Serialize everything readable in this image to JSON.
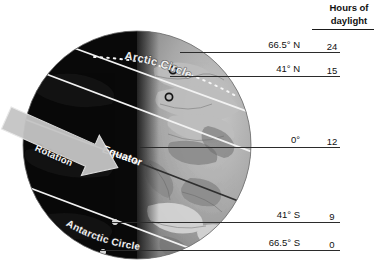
{
  "diagram": {
    "type": "earth-daylight-illumination",
    "globe": {
      "equator_label": "Equator",
      "arctic_circle_label": "Arctic Circle",
      "antarctic_circle_label": "Antarctic Circle",
      "rotation_label": "Rotation",
      "night_side_color": "#090909",
      "day_side_color": "#9a9a9a",
      "line_color": "#f2f2f2"
    },
    "header": {
      "line1": "Hours of",
      "line2": "daylight"
    },
    "rows": [
      {
        "latitude": "66.5° N",
        "hours": "24"
      },
      {
        "latitude": "41° N",
        "hours": "15"
      },
      {
        "latitude": "0°",
        "hours": "12"
      },
      {
        "latitude": "41° S",
        "hours": "9"
      },
      {
        "latitude": "66.5° S",
        "hours": "0"
      }
    ]
  }
}
